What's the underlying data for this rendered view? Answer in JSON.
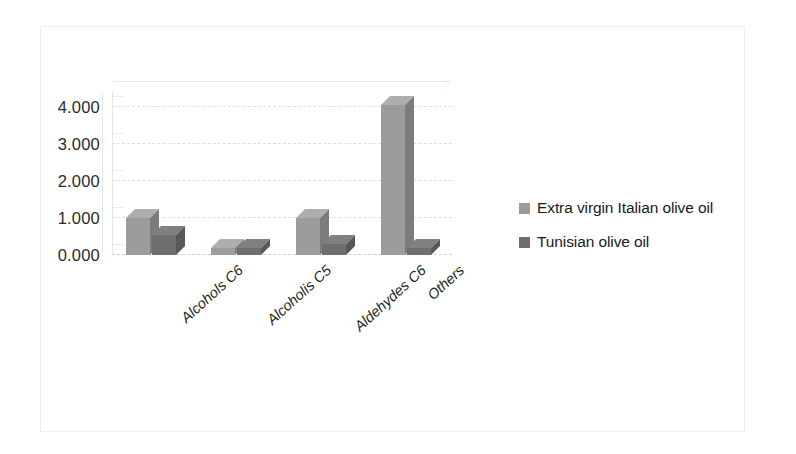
{
  "chart_data": {
    "type": "bar",
    "title": "",
    "subtitle": "",
    "xlabel": "",
    "ylabel": "",
    "categories": [
      "Alcohols C6",
      "Alcoholis C5",
      "Aldehydes C6",
      "Others"
    ],
    "series": [
      {
        "name": "Extra virgin Italian olive oil",
        "color": "#9c9c9c",
        "values": [
          1.0,
          0.18,
          1.0,
          4.05
        ]
      },
      {
        "name": "Tunisian olive oil",
        "color": "#6f6f6f",
        "values": [
          0.55,
          0.18,
          0.3,
          0.2
        ]
      }
    ],
    "ylim": [
      0,
      4.4
    ],
    "yticks": [
      0,
      1,
      2,
      3,
      4
    ],
    "ytick_labels": [
      "0.000",
      "1.000",
      "2.000",
      "3.000",
      "4.000"
    ],
    "grid": true,
    "legend_position": "right",
    "style": "3d-clustered-column"
  },
  "legend": {
    "items": [
      {
        "label": "Extra virgin Italian olive oil"
      },
      {
        "label": "Tunisian olive oil"
      }
    ]
  },
  "colors": {
    "series_1": "#9c9c9c",
    "series_2": "#6f6f6f",
    "text": "#1a1a1a",
    "gridline": "#dde1e4",
    "frame": "#eceff1",
    "background": "#ffffff"
  }
}
